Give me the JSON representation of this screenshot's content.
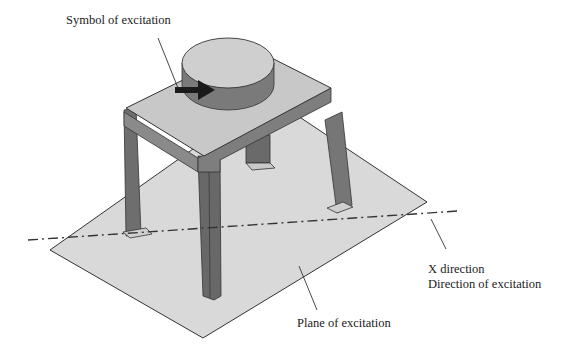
{
  "figure": {
    "type": "isometric-diagram",
    "labels": {
      "symbol": "Symbol of excitation",
      "x_direction": "X direction",
      "direction": "Direction of excitation",
      "plane": "Plane of excitation"
    },
    "colors": {
      "plane_fill": "#d9d9d9",
      "table_top": "#c8c8c8",
      "legs": "#6e6e6e",
      "cylinder_top": "#cfcfcf",
      "cylinder_side": "#7a7a7a",
      "arrow": "#1a1a1a",
      "outline": "#333333"
    }
  }
}
